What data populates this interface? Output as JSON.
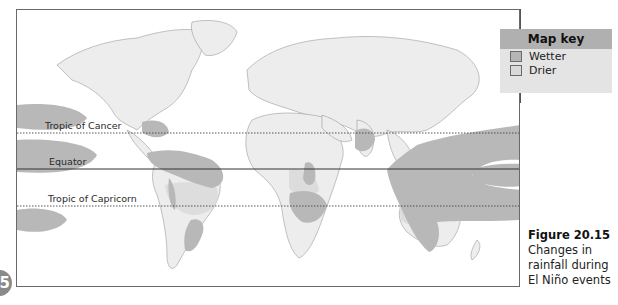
{
  "map": {
    "title": "Changes in rainfall during El Niño events",
    "colors": {
      "ocean": "#ffffff",
      "land": "#ededed",
      "coast": "#9a9a9a",
      "wetter": "#b8b8b8",
      "drier": "#dcdcdc",
      "frame": "#6a6a6a"
    },
    "lines": {
      "tropic_of_cancer": "Tropic of Cancer",
      "equator": "Equator",
      "tropic_of_capricorn": "Tropic of Capricorn"
    }
  },
  "key": {
    "title": "Map key",
    "items": [
      {
        "label": "Wetter",
        "color": "#b5b5b5"
      },
      {
        "label": "Drier",
        "color": "#d9d9d9"
      }
    ]
  },
  "caption": {
    "figure": "Figure 20.15",
    "text": "Changes in rainfall during El Niño events"
  },
  "badge": {
    "label": "5"
  }
}
